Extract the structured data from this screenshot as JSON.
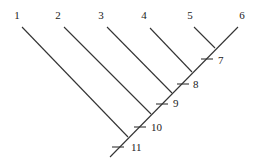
{
  "diagram": {
    "type": "cladogram",
    "taxa": [
      {
        "id": "1",
        "label": "1",
        "lx": 17,
        "ly": 19,
        "x1": 22,
        "y1": 27,
        "x2": 128,
        "y2": 137
      },
      {
        "id": "2",
        "label": "2",
        "lx": 58,
        "ly": 19,
        "x1": 64,
        "y1": 27,
        "x2": 151,
        "y2": 114
      },
      {
        "id": "3",
        "label": "3",
        "lx": 101,
        "ly": 19,
        "x1": 107,
        "y1": 27,
        "x2": 172,
        "y2": 93
      },
      {
        "id": "4",
        "label": "4",
        "lx": 144,
        "ly": 19,
        "x1": 150,
        "y1": 28,
        "x2": 192,
        "y2": 72
      },
      {
        "id": "5",
        "label": "5",
        "lx": 190,
        "ly": 19,
        "x1": 194,
        "y1": 27,
        "x2": 215,
        "y2": 48
      },
      {
        "id": "6",
        "label": "6",
        "lx": 242,
        "ly": 19
      }
    ],
    "trunk": {
      "x1": 238,
      "y1": 27,
      "x2": 110,
      "y2": 157
    },
    "characters": [
      {
        "id": "7",
        "label": "7",
        "tx": 207,
        "ty": 59,
        "lx": 218,
        "ly": 64
      },
      {
        "id": "8",
        "label": "8",
        "tx": 183,
        "ty": 84,
        "lx": 193,
        "ly": 88
      },
      {
        "id": "9",
        "label": "9",
        "tx": 162,
        "ty": 104,
        "lx": 173,
        "ly": 107
      },
      {
        "id": "10",
        "label": "10",
        "tx": 140,
        "ty": 127,
        "lx": 151,
        "ly": 131
      },
      {
        "id": "11",
        "label": "11",
        "tx": 118,
        "ty": 147,
        "lx": 131,
        "ly": 151
      }
    ],
    "colors": {
      "line": "#333333",
      "text": "#222222",
      "background": "#ffffff"
    }
  }
}
